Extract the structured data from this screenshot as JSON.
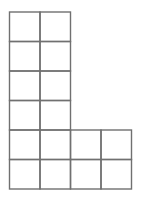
{
  "diagram": {
    "type": "grid-shape",
    "line_color": "#707070",
    "line_width": 1.4,
    "background": "#ffffff",
    "cell_size": 30,
    "origin": {
      "x": 9.5,
      "y": 12
    },
    "columns_x": [
      9.5,
      40,
      70.5,
      101,
      131.5
    ],
    "rows_y": [
      12,
      41.5,
      71,
      100.5,
      130,
      159.5,
      189
    ],
    "cells": [
      {
        "row": 0,
        "col": 0
      },
      {
        "row": 0,
        "col": 1
      },
      {
        "row": 1,
        "col": 0
      },
      {
        "row": 1,
        "col": 1
      },
      {
        "row": 2,
        "col": 0
      },
      {
        "row": 2,
        "col": 1
      },
      {
        "row": 3,
        "col": 0
      },
      {
        "row": 3,
        "col": 1
      },
      {
        "row": 4,
        "col": 0
      },
      {
        "row": 4,
        "col": 1
      },
      {
        "row": 4,
        "col": 2
      },
      {
        "row": 4,
        "col": 3
      },
      {
        "row": 5,
        "col": 0
      },
      {
        "row": 5,
        "col": 1
      },
      {
        "row": 5,
        "col": 2
      },
      {
        "row": 5,
        "col": 3
      }
    ],
    "total_squares": 16
  }
}
